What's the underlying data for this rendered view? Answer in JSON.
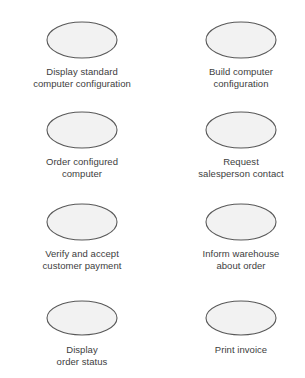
{
  "diagram": {
    "type": "uml-use-case-diagram",
    "background_color": "#ffffff",
    "shape": "ellipse",
    "ellipse_fill": "#f2f2f2",
    "ellipse_stroke": "#595959",
    "label_color": "#3d3d3d",
    "columns": 2,
    "rows": 4,
    "use_cases": [
      {
        "id": "display-standard-computer-configuration",
        "label": "Display standard\ncomputer configuration",
        "column": "left",
        "row": 1
      },
      {
        "id": "build-computer-configuration",
        "label": "Build computer\nconfiguration",
        "column": "right",
        "row": 1
      },
      {
        "id": "order-configured-computer",
        "label": "Order configured\ncomputer",
        "column": "left",
        "row": 2
      },
      {
        "id": "request-salesperson-contact",
        "label": "Request\nsalesperson contact",
        "column": "right",
        "row": 2
      },
      {
        "id": "verify-and-accept-customer-payment",
        "label": "Verify and accept\ncustomer payment",
        "column": "left",
        "row": 3
      },
      {
        "id": "inform-warehouse-about-order",
        "label": "Inform warehouse\nabout order",
        "column": "right",
        "row": 3
      },
      {
        "id": "display-order-status",
        "label": "Display\norder status",
        "column": "left",
        "row": 4
      },
      {
        "id": "print-invoice",
        "label": "Print invoice",
        "column": "right",
        "row": 4
      }
    ]
  }
}
